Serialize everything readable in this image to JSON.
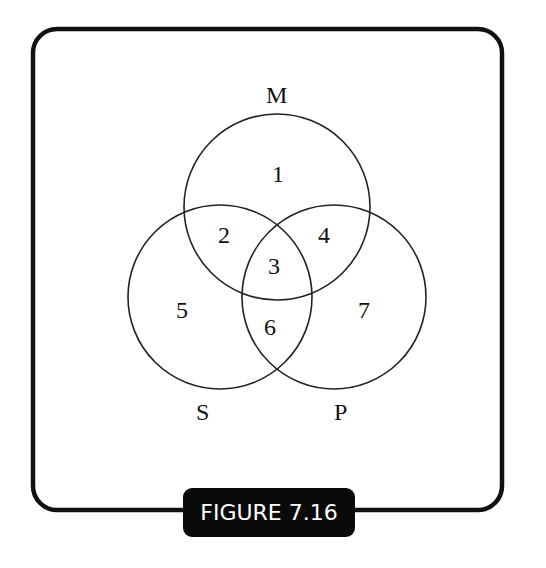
{
  "figure": {
    "caption": "FIGURE 7.16",
    "set_labels": {
      "m": "M",
      "s": "S",
      "p": "P"
    },
    "regions": [
      "1",
      "2",
      "3",
      "4",
      "5",
      "6",
      "7"
    ]
  }
}
